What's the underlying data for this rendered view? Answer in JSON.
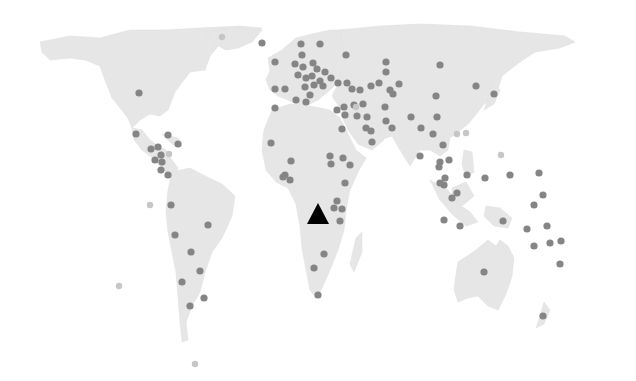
{
  "map": {
    "title": "",
    "projection": "world-dot-map",
    "colors": {
      "background": "#ffffff",
      "land": "#e6e6e6",
      "marker": "#858585",
      "marker_light": "#c6c6c6",
      "highlight": "#000000"
    },
    "highlight_marker": {
      "shape": "triangle",
      "x": 318,
      "y": 215,
      "region": "Central Africa (Angola)"
    },
    "markers": [
      {
        "x": 139,
        "y": 93
      },
      {
        "x": 262,
        "y": 43
      },
      {
        "x": 136,
        "y": 134
      },
      {
        "x": 168,
        "y": 135
      },
      {
        "x": 178,
        "y": 144
      },
      {
        "x": 151,
        "y": 149
      },
      {
        "x": 158,
        "y": 147
      },
      {
        "x": 161,
        "y": 155
      },
      {
        "x": 155,
        "y": 160
      },
      {
        "x": 162,
        "y": 162
      },
      {
        "x": 161,
        "y": 170
      },
      {
        "x": 168,
        "y": 175
      },
      {
        "x": 171,
        "y": 205
      },
      {
        "x": 208,
        "y": 225
      },
      {
        "x": 175,
        "y": 235
      },
      {
        "x": 191,
        "y": 252
      },
      {
        "x": 200,
        "y": 271
      },
      {
        "x": 182,
        "y": 282
      },
      {
        "x": 204,
        "y": 298
      },
      {
        "x": 190,
        "y": 306
      },
      {
        "x": 275,
        "y": 62
      },
      {
        "x": 301,
        "y": 44
      },
      {
        "x": 320,
        "y": 44
      },
      {
        "x": 346,
        "y": 55
      },
      {
        "x": 302,
        "y": 55
      },
      {
        "x": 295,
        "y": 64
      },
      {
        "x": 303,
        "y": 67
      },
      {
        "x": 313,
        "y": 63
      },
      {
        "x": 317,
        "y": 69
      },
      {
        "x": 325,
        "y": 72
      },
      {
        "x": 298,
        "y": 75
      },
      {
        "x": 306,
        "y": 78
      },
      {
        "x": 312,
        "y": 76
      },
      {
        "x": 320,
        "y": 81
      },
      {
        "x": 331,
        "y": 78
      },
      {
        "x": 305,
        "y": 87
      },
      {
        "x": 314,
        "y": 85
      },
      {
        "x": 323,
        "y": 86
      },
      {
        "x": 310,
        "y": 95
      },
      {
        "x": 296,
        "y": 100
      },
      {
        "x": 338,
        "y": 83
      },
      {
        "x": 306,
        "y": 102
      },
      {
        "x": 275,
        "y": 89
      },
      {
        "x": 285,
        "y": 89
      },
      {
        "x": 275,
        "y": 108
      },
      {
        "x": 347,
        "y": 83
      },
      {
        "x": 386,
        "y": 72
      },
      {
        "x": 379,
        "y": 83
      },
      {
        "x": 352,
        "y": 89
      },
      {
        "x": 360,
        "y": 90
      },
      {
        "x": 371,
        "y": 86
      },
      {
        "x": 390,
        "y": 90
      },
      {
        "x": 393,
        "y": 94
      },
      {
        "x": 399,
        "y": 84
      },
      {
        "x": 344,
        "y": 107
      },
      {
        "x": 354,
        "y": 105
      },
      {
        "x": 363,
        "y": 104
      },
      {
        "x": 367,
        "y": 117
      },
      {
        "x": 337,
        "y": 110
      },
      {
        "x": 345,
        "y": 115
      },
      {
        "x": 357,
        "y": 116
      },
      {
        "x": 366,
        "y": 128
      },
      {
        "x": 371,
        "y": 131
      },
      {
        "x": 342,
        "y": 129
      },
      {
        "x": 372,
        "y": 142
      },
      {
        "x": 385,
        "y": 107
      },
      {
        "x": 386,
        "y": 121
      },
      {
        "x": 392,
        "y": 128
      },
      {
        "x": 271,
        "y": 143
      },
      {
        "x": 291,
        "y": 161
      },
      {
        "x": 285,
        "y": 175
      },
      {
        "x": 290,
        "y": 180
      },
      {
        "x": 283,
        "y": 177
      },
      {
        "x": 330,
        "y": 156
      },
      {
        "x": 343,
        "y": 158
      },
      {
        "x": 350,
        "y": 165
      },
      {
        "x": 345,
        "y": 183
      },
      {
        "x": 342,
        "y": 209
      },
      {
        "x": 331,
        "y": 164
      },
      {
        "x": 337,
        "y": 201
      },
      {
        "x": 334,
        "y": 208
      },
      {
        "x": 340,
        "y": 221
      },
      {
        "x": 324,
        "y": 254
      },
      {
        "x": 314,
        "y": 268
      },
      {
        "x": 318,
        "y": 295
      },
      {
        "x": 411,
        "y": 117
      },
      {
        "x": 436,
        "y": 96
      },
      {
        "x": 437,
        "y": 117
      },
      {
        "x": 421,
        "y": 128
      },
      {
        "x": 433,
        "y": 134
      },
      {
        "x": 443,
        "y": 145
      },
      {
        "x": 420,
        "y": 156
      },
      {
        "x": 440,
        "y": 162
      },
      {
        "x": 449,
        "y": 160
      },
      {
        "x": 445,
        "y": 178
      },
      {
        "x": 439,
        "y": 167
      },
      {
        "x": 440,
        "y": 183
      },
      {
        "x": 476,
        "y": 86
      },
      {
        "x": 494,
        "y": 94
      },
      {
        "x": 440,
        "y": 65
      },
      {
        "x": 386,
        "y": 62
      },
      {
        "x": 467,
        "y": 175
      },
      {
        "x": 485,
        "y": 178
      },
      {
        "x": 510,
        "y": 175
      },
      {
        "x": 539,
        "y": 173
      },
      {
        "x": 457,
        "y": 193
      },
      {
        "x": 444,
        "y": 185
      },
      {
        "x": 452,
        "y": 198
      },
      {
        "x": 543,
        "y": 195
      },
      {
        "x": 534,
        "y": 205
      },
      {
        "x": 444,
        "y": 220
      },
      {
        "x": 460,
        "y": 226
      },
      {
        "x": 503,
        "y": 221
      },
      {
        "x": 527,
        "y": 229
      },
      {
        "x": 547,
        "y": 226
      },
      {
        "x": 534,
        "y": 246
      },
      {
        "x": 550,
        "y": 243
      },
      {
        "x": 561,
        "y": 241
      },
      {
        "x": 560,
        "y": 264
      },
      {
        "x": 484,
        "y": 272
      },
      {
        "x": 543,
        "y": 316
      }
    ],
    "light_markers": [
      {
        "x": 222,
        "y": 37
      },
      {
        "x": 169,
        "y": 154
      },
      {
        "x": 150,
        "y": 205
      },
      {
        "x": 119,
        "y": 286
      },
      {
        "x": 195,
        "y": 364
      },
      {
        "x": 457,
        "y": 134
      },
      {
        "x": 466,
        "y": 133
      },
      {
        "x": 501,
        "y": 155
      },
      {
        "x": 356,
        "y": 107
      }
    ]
  }
}
